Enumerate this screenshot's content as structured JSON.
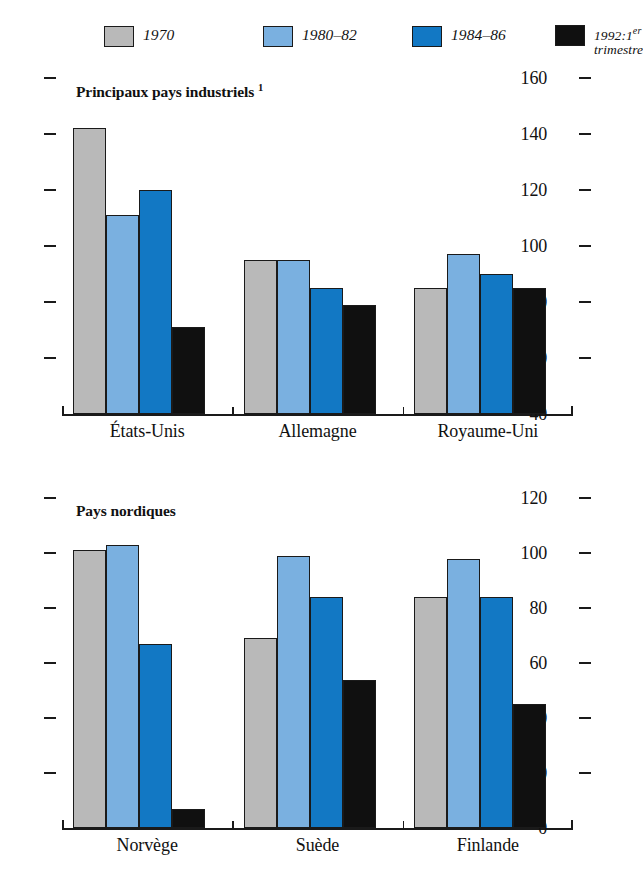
{
  "legend": {
    "items": [
      {
        "label": "1970",
        "color": "#b9b9b9",
        "name": "legend-1970"
      },
      {
        "label": "1980–82",
        "color": "#7ab0e0",
        "name": "legend-1980-82"
      },
      {
        "label": "1984–86",
        "color": "#1278c4",
        "name": "legend-1984-86"
      },
      {
        "label": "1992:1er\ntrimestre",
        "color": "#101010",
        "name": "legend-1992"
      }
    ]
  },
  "chart_data": [
    {
      "type": "bar",
      "title": "Principaux pays industriels",
      "title_superscript": "1",
      "categories": [
        "États-Unis",
        "Allemagne",
        "Royaume-Uni"
      ],
      "series": [
        {
          "name": "1970",
          "color": "#b9b9b9",
          "values": [
            142,
            95,
            85
          ]
        },
        {
          "name": "1980–82",
          "color": "#7ab0e0",
          "values": [
            111,
            95,
            97
          ]
        },
        {
          "name": "1984–86",
          "color": "#1278c4",
          "values": [
            120,
            85,
            90
          ]
        },
        {
          "name": "1992:1er trimestre",
          "color": "#101010",
          "values": [
            71,
            79,
            85
          ]
        }
      ],
      "ylim": [
        40,
        160
      ],
      "yticks": [
        40,
        60,
        80,
        100,
        120,
        140,
        160
      ],
      "ytick_labels": [
        "40",
        "60",
        "80",
        "100",
        "120",
        "140",
        "160"
      ],
      "xlabel": "",
      "ylabel": "",
      "grid": false,
      "legend_position": "top"
    },
    {
      "type": "bar",
      "title": "Pays nordiques",
      "title_superscript": "",
      "categories": [
        "Norvège",
        "Suède",
        "Finlande"
      ],
      "series": [
        {
          "name": "1970",
          "color": "#b9b9b9",
          "values": [
            101,
            69,
            84
          ]
        },
        {
          "name": "1980–82",
          "color": "#7ab0e0",
          "values": [
            103,
            99,
            98
          ]
        },
        {
          "name": "1984–86",
          "color": "#1278c4",
          "values": [
            67,
            84,
            84
          ]
        },
        {
          "name": "1992:1er trimestre",
          "color": "#101010",
          "values": [
            7,
            54,
            45
          ]
        }
      ],
      "ylim": [
        0,
        120
      ],
      "yticks": [
        0,
        20,
        40,
        60,
        80,
        100,
        120
      ],
      "ytick_labels": [
        "0",
        "20",
        "40",
        "60",
        "80",
        "100",
        "120"
      ],
      "xlabel": "",
      "ylabel": "",
      "grid": false,
      "legend_position": "top"
    }
  ]
}
